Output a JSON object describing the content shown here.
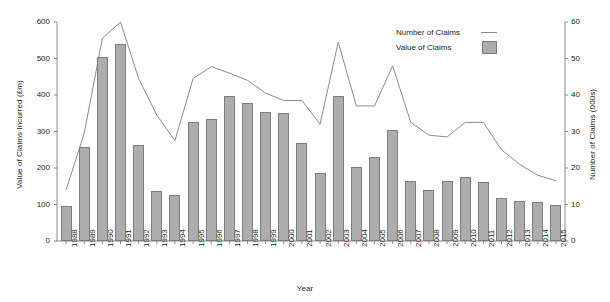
{
  "chart_data": {
    "type": "bar",
    "title": "",
    "xlabel": "Year",
    "ylabel": "Value of Claims Incurred (£m)",
    "y2label": "Number of Claims (000s)",
    "grid": false,
    "legend_position": "top-right",
    "ylim": [
      0,
      600
    ],
    "y2lim": [
      0,
      60
    ],
    "yticks": [
      0,
      100,
      200,
      300,
      400,
      500,
      600
    ],
    "y2ticks": [
      0,
      10,
      20,
      30,
      40,
      50,
      60
    ],
    "categories": [
      "1988",
      "1989",
      "1990",
      "1991",
      "1992",
      "1993",
      "1994",
      "1995",
      "1996",
      "1997",
      "1998",
      "1999",
      "2000",
      "2001",
      "2002",
      "2003",
      "2004",
      "2005",
      "2006",
      "2007",
      "2008",
      "2009",
      "2010",
      "2011",
      "2012",
      "2013",
      "2014",
      "2015"
    ],
    "series": [
      {
        "name": "Value of Claims",
        "type": "bar",
        "axis": "left",
        "units": "£m",
        "color": "#adadad",
        "values": [
          95,
          258,
          505,
          540,
          262,
          136,
          126,
          327,
          333,
          396,
          378,
          353,
          352,
          268,
          186,
          396,
          204,
          231,
          305,
          165,
          141,
          164,
          176,
          162,
          119,
          109,
          108,
          98
        ]
      },
      {
        "name": "Number of Claims",
        "type": "line",
        "axis": "right",
        "units": "000s",
        "color": "#8a8a8a",
        "values": [
          14.0,
          29.5,
          55.5,
          60.0,
          44.5,
          34.5,
          27.5,
          44.5,
          47.8,
          46.0,
          44.0,
          40.5,
          38.5,
          38.5,
          32.0,
          54.5,
          37.0,
          37.0,
          48.0,
          32.5,
          29.0,
          28.5,
          32.5,
          32.5,
          25.0,
          21.0,
          18.0,
          16.5
        ]
      }
    ]
  },
  "legend": {
    "entries": [
      {
        "label": "Number of Claims",
        "marker": "line"
      },
      {
        "label": "Value of Claims",
        "marker": "swatch"
      }
    ]
  }
}
